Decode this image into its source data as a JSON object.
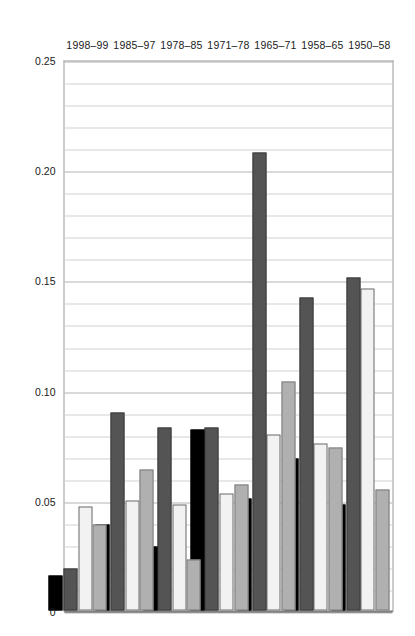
{
  "chart_data": {
    "type": "bar",
    "orientation": "horizontal-rotated",
    "title": "",
    "xlabel": "",
    "ylabel": "Average annual rates of change",
    "categories": [
      "1950–58",
      "1958–65",
      "1965–71",
      "1971–78",
      "1978–85",
      "1985–97",
      "1998–99"
    ],
    "tick_labels": [
      "0",
      "0.05",
      "0.10",
      "0.15",
      "0.20",
      "0.25"
    ],
    "tick_values": [
      0,
      0.05,
      0.1,
      0.15,
      0.2,
      0.25
    ],
    "ylim": [
      0,
      0.25
    ],
    "minor_gridline_step": 0.01,
    "grid": true,
    "legend_position": "bottom-right",
    "series": [
      {
        "name": "US",
        "color": "#000000",
        "values": [
          0.048,
          0.069,
          0.051,
          0.082,
          0.029,
          0.039,
          0.016
        ]
      },
      {
        "name": "Japan",
        "color": "#545454",
        "values": [
          0.151,
          0.142,
          0.208,
          0.083,
          0.083,
          0.09,
          0.019
        ]
      },
      {
        "name": "Germany",
        "color": "#f2f2f2",
        "values": [
          0.146,
          0.076,
          0.08,
          0.053,
          0.048,
          0.05,
          0.047
        ]
      },
      {
        "name": "World",
        "color": "#b0b0b0",
        "values": [
          0.055,
          0.074,
          0.104,
          0.057,
          0.023,
          0.064,
          0.039
        ]
      }
    ]
  },
  "legend": {
    "items": [
      {
        "label": "US"
      },
      {
        "label": "Japan"
      },
      {
        "label": "Germany"
      },
      {
        "label": "World"
      }
    ]
  }
}
